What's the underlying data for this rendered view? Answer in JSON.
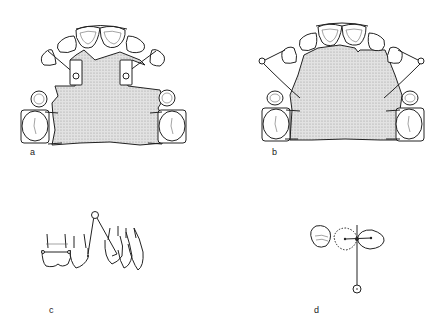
{
  "figure": {
    "panels": [
      {
        "id": "a",
        "label": "a",
        "description": "Upper removable plate with two finger springs in guides (occlusal view)"
      },
      {
        "id": "b",
        "label": "b",
        "description": "Upper removable plate with buccal springs with coils (occlusal view)"
      },
      {
        "id": "c",
        "label": "c",
        "description": "Lateral view of spring with coil acting on tooth"
      },
      {
        "id": "d",
        "label": "d",
        "description": "Schematic of tooth movement direction from spring coil position"
      }
    ],
    "colors": {
      "line": "#222222",
      "plate_fill": "#d8d8d8",
      "background": "#ffffff"
    }
  }
}
